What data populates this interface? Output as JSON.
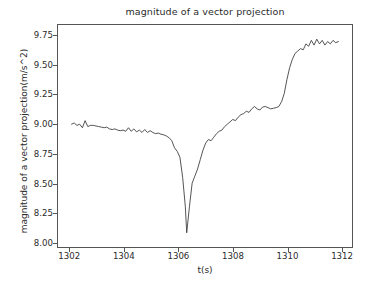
{
  "chart_data": {
    "type": "line",
    "title": "magnitude of a vector projection",
    "xlabel": "t(s)",
    "ylabel": "magnitude of a vector projection(m/s^2)",
    "xlim": [
      1301.55,
      1312.4
    ],
    "ylim": [
      7.96,
      9.84
    ],
    "xticks": [
      1302,
      1304,
      1306,
      1308,
      1310,
      1312
    ],
    "xticklabels": [
      "1302",
      "1304",
      "1306",
      "1308",
      "1310",
      "1312"
    ],
    "yticks": [
      8.0,
      8.25,
      8.5,
      8.75,
      9.0,
      9.25,
      9.5,
      9.75
    ],
    "yticklabels": [
      "8.00",
      "8.25",
      "8.50",
      "8.75",
      "9.00",
      "9.25",
      "9.50",
      "9.75"
    ],
    "grid": false,
    "legend": false,
    "line_color": "#404040",
    "line_width": 0.9,
    "series": [
      {
        "name": "magnitude of a vector projection",
        "x": [
          1302.05,
          1302.15,
          1302.25,
          1302.35,
          1302.45,
          1302.55,
          1302.65,
          1302.75,
          1302.85,
          1302.95,
          1303.05,
          1303.15,
          1303.25,
          1303.35,
          1303.45,
          1303.55,
          1303.65,
          1303.75,
          1303.85,
          1303.95,
          1304.05,
          1304.15,
          1304.25,
          1304.35,
          1304.45,
          1304.55,
          1304.65,
          1304.75,
          1304.85,
          1304.95,
          1305.05,
          1305.15,
          1305.25,
          1305.35,
          1305.45,
          1305.55,
          1305.65,
          1305.75,
          1305.85,
          1305.95,
          1306.05,
          1306.15,
          1306.25,
          1306.3,
          1306.4,
          1306.5,
          1306.6,
          1306.7,
          1306.8,
          1306.9,
          1307.0,
          1307.1,
          1307.2,
          1307.3,
          1307.4,
          1307.5,
          1307.6,
          1307.7,
          1307.8,
          1307.9,
          1308.0,
          1308.1,
          1308.2,
          1308.3,
          1308.4,
          1308.5,
          1308.6,
          1308.7,
          1308.8,
          1308.9,
          1309.0,
          1309.1,
          1309.2,
          1309.3,
          1309.4,
          1309.5,
          1309.6,
          1309.7,
          1309.8,
          1309.9,
          1310.0,
          1310.1,
          1310.2,
          1310.3,
          1310.4,
          1310.5,
          1310.6,
          1310.7,
          1310.8,
          1310.9,
          1311.0,
          1311.1,
          1311.2,
          1311.3,
          1311.4,
          1311.5,
          1311.6,
          1311.7,
          1311.8,
          1311.9
        ],
        "y": [
          9.0,
          9.01,
          8.99,
          9.0,
          8.97,
          9.03,
          8.98,
          8.99,
          8.99,
          8.985,
          8.98,
          8.975,
          8.97,
          8.975,
          8.96,
          8.955,
          8.96,
          8.95,
          8.945,
          8.95,
          8.94,
          8.97,
          8.94,
          8.96,
          8.935,
          8.95,
          8.93,
          8.955,
          8.93,
          8.945,
          8.93,
          8.92,
          8.925,
          8.915,
          8.91,
          8.9,
          8.885,
          8.86,
          8.8,
          8.77,
          8.72,
          8.55,
          8.3,
          8.08,
          8.3,
          8.5,
          8.56,
          8.62,
          8.7,
          8.78,
          8.84,
          8.87,
          8.86,
          8.89,
          8.92,
          8.94,
          8.95,
          8.98,
          9.0,
          9.02,
          9.04,
          9.03,
          9.06,
          9.08,
          9.09,
          9.11,
          9.1,
          9.13,
          9.15,
          9.13,
          9.12,
          9.145,
          9.15,
          9.14,
          9.13,
          9.135,
          9.14,
          9.15,
          9.19,
          9.26,
          9.38,
          9.48,
          9.55,
          9.6,
          9.62,
          9.64,
          9.63,
          9.68,
          9.66,
          9.71,
          9.67,
          9.72,
          9.68,
          9.71,
          9.67,
          9.7,
          9.68,
          9.71,
          9.69,
          9.7
        ]
      }
    ]
  }
}
